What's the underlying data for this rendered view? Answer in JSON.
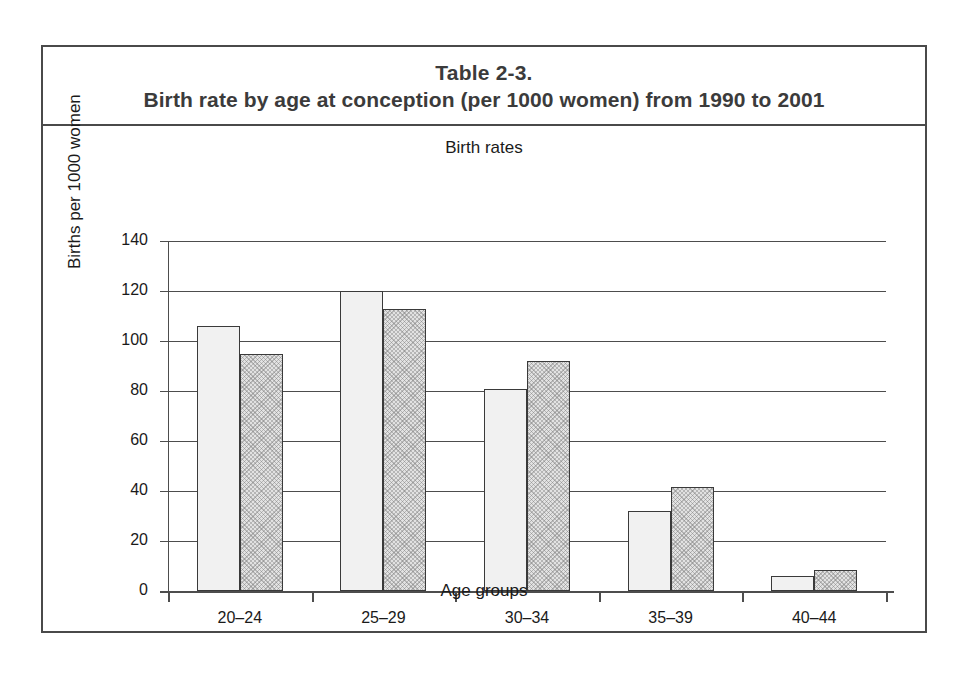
{
  "table": {
    "caption_line1": "Table 2-3.",
    "caption_line2": "Birth rate by age at conception (per 1000 women) from 1990 to 2001"
  },
  "chart_data": {
    "type": "bar",
    "title": "Birth rates",
    "xlabel": "Age groups",
    "ylabel": "Births per 1000 women",
    "categories": [
      "20–24",
      "25–29",
      "30–34",
      "35–39",
      "40–44"
    ],
    "series": [
      {
        "name": "1990",
        "values": [
          106,
          120,
          81,
          32,
          6
        ]
      },
      {
        "name": "2001",
        "values": [
          95,
          113,
          92,
          41.5,
          8.5
        ]
      }
    ],
    "ylim": [
      0,
      140
    ],
    "yticks": [
      0,
      20,
      40,
      60,
      80,
      100,
      120,
      140
    ],
    "ytick_labels": [
      "0",
      "20",
      "40",
      "60",
      "80",
      "100",
      "120",
      "140"
    ],
    "grid": true,
    "legend": "none",
    "series_styles": [
      {
        "name": "1990",
        "fill": "#f1f1f1",
        "pattern": "solid-light",
        "border": "#3a3a3a"
      },
      {
        "name": "2001",
        "fill": "#e2e2e2",
        "pattern": "cross-hatch",
        "border": "#3a3a3a"
      }
    ]
  },
  "colors": {
    "frame": "#4a4a4a",
    "axis": "#4d4d4d",
    "text": "#1a1a1a",
    "title_text": "#3b3b3b",
    "background": "#ffffff"
  }
}
